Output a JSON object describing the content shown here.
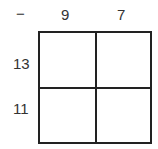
{
  "operator": "−",
  "columns": [
    "9",
    "7"
  ],
  "rows": [
    "13",
    "11"
  ],
  "cells": [
    [
      "",
      ""
    ],
    [
      "",
      ""
    ]
  ],
  "colors": {
    "line": "#222222",
    "text": "#333333",
    "background": "#ffffff"
  }
}
